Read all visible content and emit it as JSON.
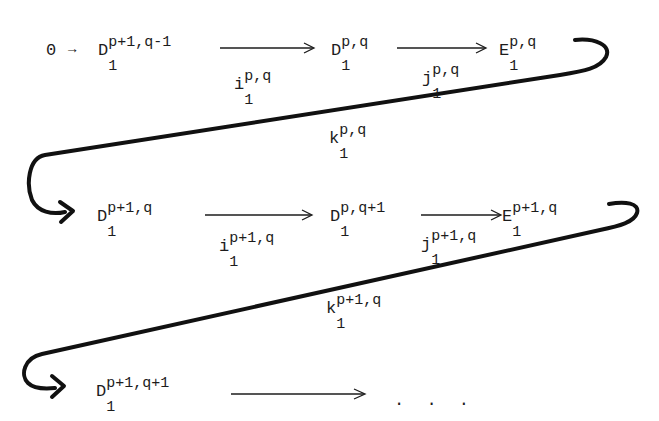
{
  "diagram": {
    "type": "long exact sequence (exact couple)",
    "row1": {
      "zero": "0",
      "zero_arrow": "→",
      "D1": {
        "base": "D",
        "sub": "1",
        "sup": "p+1,q-1"
      },
      "i": {
        "base": "i",
        "sub": "1",
        "sup": "p,q"
      },
      "D2": {
        "base": "D",
        "sub": "1",
        "sup": "p,q"
      },
      "j": {
        "base": "j",
        "sub": "1",
        "sup": "p,q"
      },
      "E": {
        "base": "E",
        "sub": "1",
        "sup": "p,q"
      }
    },
    "connector1": {
      "k": {
        "base": "k",
        "sub": "1",
        "sup": "p,q"
      }
    },
    "row2": {
      "D1": {
        "base": "D",
        "sub": "1",
        "sup": "p+1,q"
      },
      "i": {
        "base": "i",
        "sub": "1",
        "sup": "p+1,q"
      },
      "D2": {
        "base": "D",
        "sub": "1",
        "sup": "p,q+1"
      },
      "j": {
        "base": "j",
        "sub": "1",
        "sup": "p+1,q"
      },
      "E": {
        "base": "E",
        "sub": "1",
        "sup": "p+1,q"
      }
    },
    "connector2": {
      "k": {
        "base": "k",
        "sub": "1",
        "sup": "p+1,q"
      }
    },
    "row3": {
      "D1": {
        "base": "D",
        "sub": "1",
        "sup": "p+1,q+1"
      },
      "ellipsis": ". . ."
    }
  }
}
